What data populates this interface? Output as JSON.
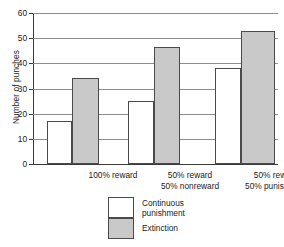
{
  "chart_data": {
    "type": "bar",
    "title": "",
    "xlabel": "",
    "ylabel": "Number of punches",
    "ylim": [
      0,
      60
    ],
    "yticks": [
      0,
      10,
      20,
      30,
      40,
      50,
      60
    ],
    "ytick_labels": [
      "0",
      "10",
      "20",
      "30",
      "40",
      "50",
      "60"
    ],
    "grid": true,
    "legend_position": "bottom-center",
    "categories": [
      "100% reward",
      "50% reward\n50% nonreward",
      "50% reward\n50% punishment"
    ],
    "category_lines": [
      [
        "100% reward"
      ],
      [
        "50% reward",
        "50% nonreward"
      ],
      [
        "50% reward",
        "50% punishment"
      ]
    ],
    "series": [
      {
        "name": "Continuous punishment",
        "color": "#ffffff",
        "values": [
          17,
          25,
          38
        ]
      },
      {
        "name": "Extinction",
        "color": "#c9c9c9",
        "values": [
          34,
          46.5,
          53
        ]
      }
    ]
  },
  "legend": {
    "items": [
      {
        "label": "Continuous\npunishment",
        "swatch": "white"
      },
      {
        "label": "Extinction",
        "swatch": "gray"
      }
    ]
  },
  "colors": {
    "bar_fill_continuous": "#ffffff",
    "bar_fill_extinction": "#c9c9c9",
    "bar_outline": "#4a4a4a",
    "gridline": "#8e8e8e",
    "axis": "#3a3a3a",
    "text": "#1a1a1a",
    "background": "#ffffff"
  }
}
